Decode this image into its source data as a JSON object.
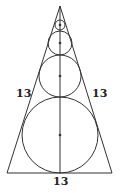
{
  "diagram": {
    "type": "geometry",
    "stroke_color": "#333333",
    "labels": {
      "left_side": "13",
      "right_side": "13",
      "base": "13"
    },
    "triangle": {
      "apex": [
        60,
        6
      ],
      "base_left": [
        7,
        173
      ],
      "base_right": [
        112,
        173
      ]
    },
    "altitude": {
      "from": [
        60,
        6
      ],
      "to": [
        60,
        173
      ]
    },
    "circles": [
      {
        "name": "smallest",
        "cx": 60,
        "cy": 25,
        "r": 5
      },
      {
        "name": "small",
        "cx": 60,
        "cy": 43,
        "r": 12
      },
      {
        "name": "medium",
        "cx": 60,
        "cy": 76,
        "r": 21
      },
      {
        "name": "large",
        "cx": 60,
        "cy": 135,
        "r": 38
      }
    ]
  }
}
